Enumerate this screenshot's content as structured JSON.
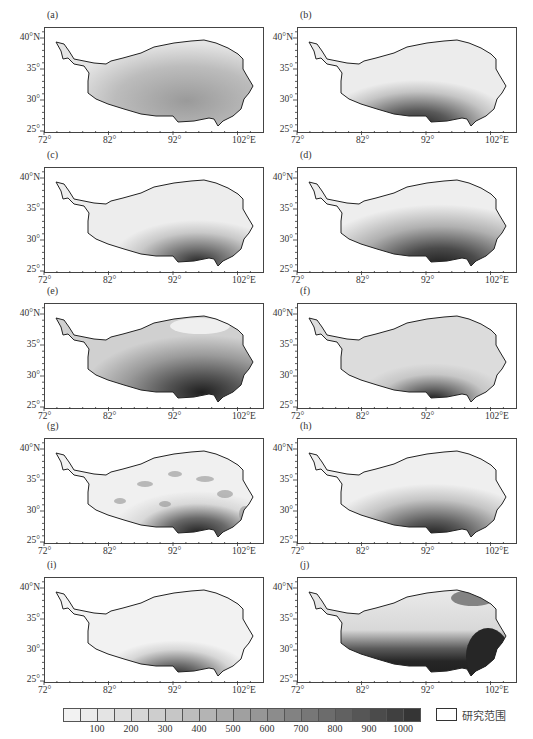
{
  "chart_data": {
    "type": "heatmap",
    "title": "",
    "panels": [
      {
        "label": "(a)",
        "pattern": "moderate values overall, darker gray in south-central and east",
        "max_region": "south-central / east"
      },
      {
        "label": "(b)",
        "pattern": "light north, dark band along southern border near 92°E",
        "max_region": "south near 90-95°E"
      },
      {
        "label": "(c)",
        "pattern": "light overall, gray in east, dark patch on southern border near 93-96°E",
        "max_region": "south near 93-96°E"
      },
      {
        "label": "(d)",
        "pattern": "gradient from light north-west to dark south-east",
        "max_region": "south near 92-96°E"
      },
      {
        "label": "(e)",
        "pattern": "textured, light in north-east, dark in south and south-east",
        "max_region": "south-east"
      },
      {
        "label": "(f)",
        "pattern": "light overall with dark patch on southern border near 93°E",
        "max_region": "south near 93°E"
      },
      {
        "label": "(g)",
        "pattern": "patchy/blotchy, dark patches along southern and south-eastern border",
        "max_region": "south near 93-96°E and south-east"
      },
      {
        "label": "(h)",
        "pattern": "light north, gray gradient to dark patch at southern border near 93°E",
        "max_region": "south near 93°E"
      },
      {
        "label": "(i)",
        "pattern": "very light overall, dark patch on southern border near 93°E",
        "max_region": "south near 93°E"
      },
      {
        "label": "(j)",
        "pattern": "light west and center, very dark across south and south-east, dark north-east corner",
        "max_region": "south and south-east"
      }
    ],
    "x_axis": {
      "ticks": [
        "72°",
        "82°",
        "92°",
        "102°E"
      ],
      "range": [
        72,
        106
      ]
    },
    "y_axis": {
      "ticks": [
        "25°",
        "30°",
        "35°",
        "40°N"
      ],
      "range": [
        25,
        42
      ]
    },
    "colorbar": {
      "type": "discrete grayscale",
      "boxes": 21,
      "tick_labels": [
        "100",
        "200",
        "300",
        "400",
        "500",
        "600",
        "700",
        "800",
        "900",
        "1000"
      ],
      "range": [
        0,
        1050
      ]
    },
    "legend": [
      {
        "symbol": "white box with black outline",
        "label": "研究范围"
      }
    ],
    "grid": false
  },
  "panels": [
    {
      "label": "(a)"
    },
    {
      "label": "(b)"
    },
    {
      "label": "(c)"
    },
    {
      "label": "(d)"
    },
    {
      "label": "(e)"
    },
    {
      "label": "(f)"
    },
    {
      "label": "(g)"
    },
    {
      "label": "(h)"
    },
    {
      "label": "(i)"
    },
    {
      "label": "(j)"
    }
  ],
  "axes": {
    "y_labels": [
      "40°N",
      "35°",
      "30°",
      "25°"
    ],
    "x_labels": [
      "72°",
      "82°",
      "92°",
      "102°E"
    ]
  },
  "colorbar": {
    "labels": [
      "100",
      "200",
      "300",
      "400",
      "500",
      "600",
      "700",
      "800",
      "900",
      "1000"
    ],
    "colors": [
      "#f2f2f2",
      "#ebebeb",
      "#e4e4e4",
      "#dddddd",
      "#d6d6d6",
      "#cecece",
      "#c6c6c6",
      "#bdbdbd",
      "#b4b4b4",
      "#aaaaaa",
      "#a0a0a0",
      "#969696",
      "#8c8c8c",
      "#828282",
      "#777777",
      "#6c6c6c",
      "#616161",
      "#565656",
      "#4b4b4b",
      "#404040",
      "#353535"
    ]
  },
  "legend": {
    "study_area_label": "研究范围"
  }
}
